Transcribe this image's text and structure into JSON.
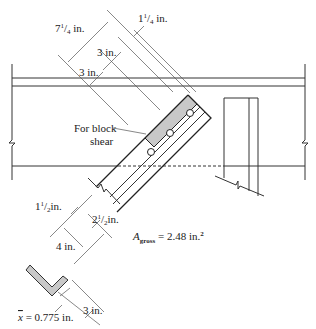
{
  "figure": {
    "colors": {
      "line": "#333333",
      "block_shear_fill": "#c8c8c8",
      "background": "#ffffff"
    },
    "labels": {
      "dim_7_1_4": {
        "whole": "7",
        "num": "1",
        "den": "4",
        "unit": " in."
      },
      "dim_1_1_4": {
        "whole": "1",
        "num": "1",
        "den": "4",
        "unit": " in."
      },
      "dim_3_upper": "3 in.",
      "dim_3_lower": "3 in.",
      "block_shear_line1": "For block",
      "block_shear_line2": "shear",
      "dim_1_1_2": {
        "whole": "1",
        "num": "1",
        "den": "2",
        "unit": "in."
      },
      "dim_2_1_2": {
        "whole": "2",
        "num": "1",
        "den": "2",
        "unit": "in."
      },
      "dim_4": "4 in.",
      "area_symbol": "A",
      "area_subscript": "gross",
      "area_value": " = 2.48 in.",
      "area_exp": "2",
      "xbar_symbol": "x",
      "xbar_value": " = 0.775 in.",
      "dim_3_section": "3 in."
    },
    "bolts": {
      "count": 3
    }
  }
}
